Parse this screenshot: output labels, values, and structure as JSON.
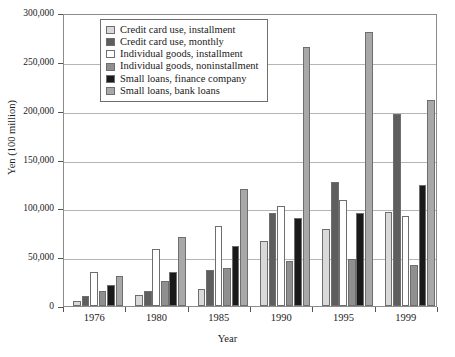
{
  "chart_data": {
    "type": "bar",
    "title": "",
    "xlabel": "Year",
    "ylabel": "Yen (100 million)",
    "categories": [
      "1976",
      "1980",
      "1985",
      "1990",
      "1995",
      "1999"
    ],
    "ylim": [
      0,
      300000
    ],
    "ytick_labels": [
      "0",
      "50,000",
      "100,000",
      "150,000",
      "200,000",
      "250,000",
      "300,000"
    ],
    "ytick_values": [
      0,
      50000,
      100000,
      150000,
      200000,
      250000,
      300000
    ],
    "grid": true,
    "legend_position": "top-left-inside",
    "series": [
      {
        "name": "Credit card use, installment",
        "color": "#d9d9d9",
        "values": [
          5500,
          11500,
          17000,
          67000,
          78500,
          96500
        ]
      },
      {
        "name": "Credit card use, monthly",
        "color": "#5e5e5e",
        "values": [
          10000,
          15500,
          36500,
          95000,
          127000,
          197000
        ]
      },
      {
        "name": "Individual goods, installment",
        "color": "#ffffff",
        "values": [
          34500,
          58500,
          82000,
          102000,
          109000,
          92000
        ]
      },
      {
        "name": "Individual goods, noninstallment",
        "color": "#8f8f8f",
        "values": [
          15500,
          25500,
          38500,
          46500,
          48500,
          42000
        ]
      },
      {
        "name": "Small loans, finance company",
        "color": "#1a1a1a",
        "values": [
          22000,
          35000,
          61500,
          90000,
          95500,
          123500
        ]
      },
      {
        "name": "Small loans, bank loans",
        "color": "#a8a8a8",
        "values": [
          30500,
          71000,
          119500,
          265000,
          281000,
          211000
        ]
      }
    ]
  }
}
